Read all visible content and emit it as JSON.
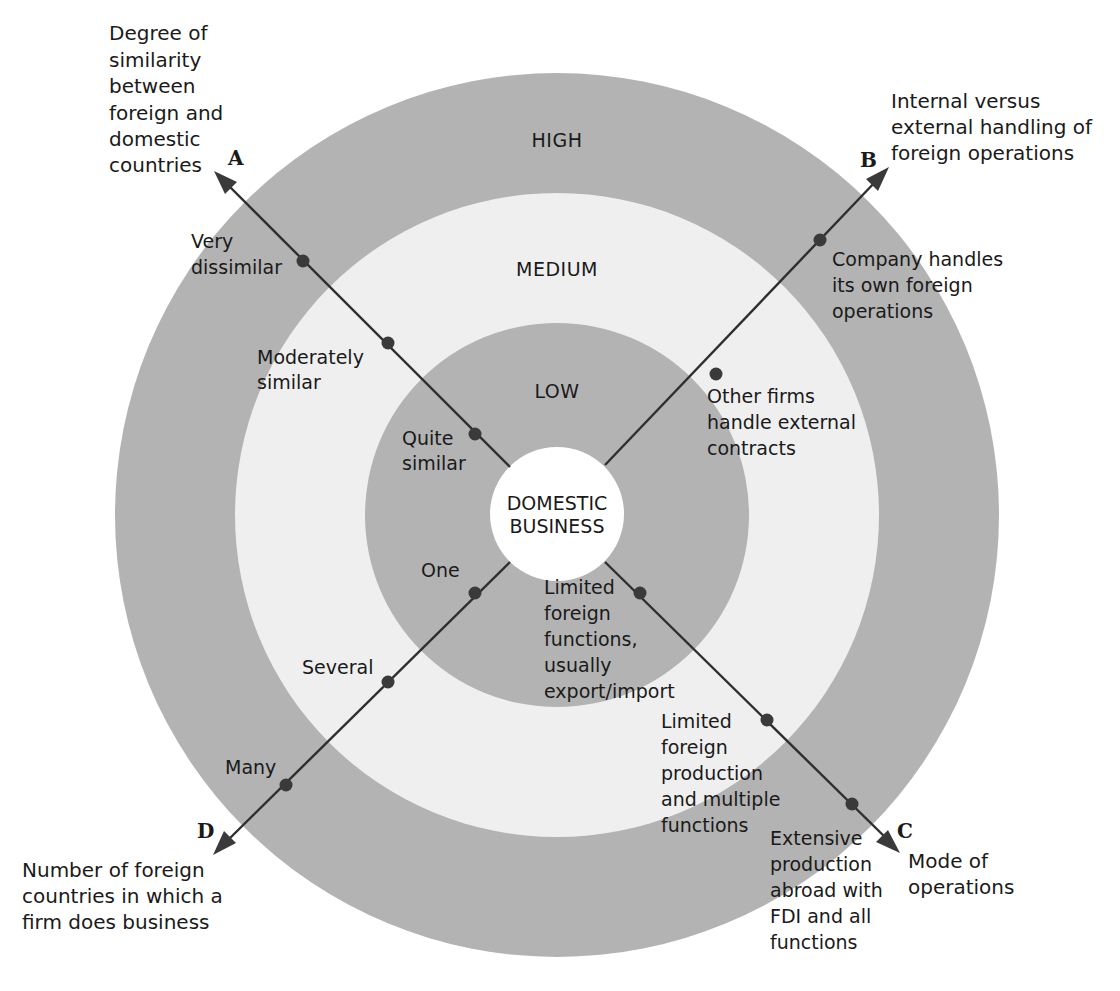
{
  "diagram": {
    "type": "concentric-rings-with-axes",
    "center": {
      "label_lines": [
        "DOMESTIC",
        "BUSINESS"
      ]
    },
    "zones": [
      {
        "label": "LOW",
        "color": "#b3b3b3"
      },
      {
        "label": "MEDIUM",
        "color": "#efefef"
      },
      {
        "label": "HIGH",
        "color": "#b3b3b3"
      }
    ],
    "axes": [
      {
        "letter": "A",
        "title_lines": [
          "Degree of",
          "similarity",
          "between",
          "foreign and",
          "domestic",
          "countries"
        ],
        "points": [
          {
            "lines": [
              "Quite",
              "similar"
            ]
          },
          {
            "lines": [
              "Moderately",
              "similar"
            ]
          },
          {
            "lines": [
              "Very",
              "dissimilar"
            ]
          }
        ]
      },
      {
        "letter": "B",
        "title_lines": [
          "Internal versus",
          "external handling of",
          "foreign operations"
        ],
        "points": [
          {
            "lines": [
              "Other firms",
              "handle external",
              "contracts"
            ]
          },
          {
            "lines": [
              "Company handles",
              "its own foreign",
              "operations"
            ]
          }
        ]
      },
      {
        "letter": "C",
        "title_lines": [
          "Mode of",
          "operations"
        ],
        "points": [
          {
            "lines": [
              "Limited",
              "foreign",
              "functions,",
              "usually",
              "export/import"
            ]
          },
          {
            "lines": [
              "Limited",
              "foreign",
              "production",
              "and multiple",
              "functions"
            ]
          },
          {
            "lines": [
              "Extensive",
              "production",
              "abroad with",
              "FDI and all",
              "functions"
            ]
          }
        ]
      },
      {
        "letter": "D",
        "title_lines": [
          "Number of foreign",
          "countries in which a",
          "firm does business"
        ],
        "points": [
          {
            "lines": [
              "One"
            ]
          },
          {
            "lines": [
              "Several"
            ]
          },
          {
            "lines": [
              "Many"
            ]
          }
        ]
      }
    ]
  }
}
